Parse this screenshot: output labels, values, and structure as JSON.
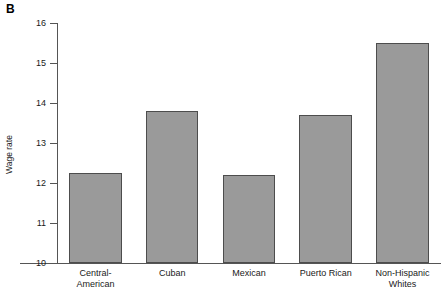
{
  "panel": {
    "letter": "B"
  },
  "chart_data": {
    "type": "bar",
    "title": "",
    "xlabel": "",
    "ylabel": "Wage rate",
    "ylim": [
      10,
      16
    ],
    "yticks": [
      10,
      11,
      12,
      13,
      14,
      15,
      16
    ],
    "ytick_labels": [
      "10",
      "11",
      "12",
      "13",
      "14",
      "15",
      "16"
    ],
    "grid": false,
    "legend": null,
    "categories": [
      "Central-American",
      "Cuban",
      "Mexican",
      "Puerto Rican",
      "Non-Hispanic Whites"
    ],
    "category_lines": [
      [
        "Central-",
        "American"
      ],
      [
        "Cuban"
      ],
      [
        "Mexican"
      ],
      [
        "Puerto Rican"
      ],
      [
        "Non-Hispanic",
        "Whites"
      ]
    ],
    "values": [
      12.25,
      13.8,
      12.2,
      13.7,
      15.5
    ],
    "bar_color": "#9a9a9a",
    "bar_edge_color": "#4d4d4d",
    "axis_color": "#555555"
  }
}
